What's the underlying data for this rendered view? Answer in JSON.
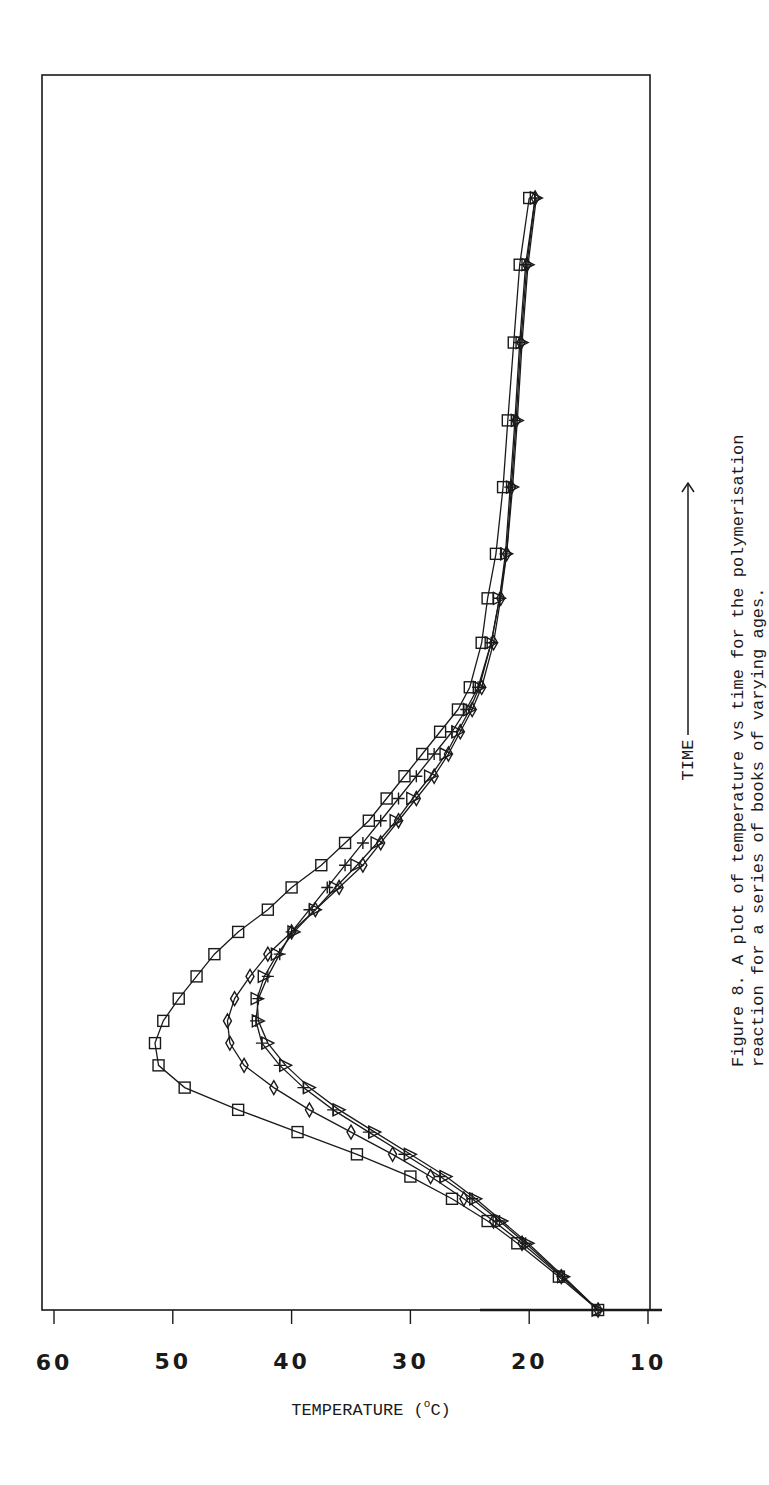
{
  "figure": {
    "caption_line1": "Figure 8. A plot of temperature vs time for the polymerisation",
    "caption_line2": "reaction for a series of books of varying ages.",
    "x_axis_title": "TIME",
    "y_axis_title": "TEMPERATURE (°C)",
    "y_axis_title_main": "TEMPERATURE",
    "y_axis_title_unit": "(oC)",
    "time_arrow": "→"
  },
  "chart_data": {
    "type": "line",
    "xlabel": "TIME",
    "ylabel": "TEMPERATURE (°C)",
    "ylim": [
      10,
      60
    ],
    "yticks": [
      10,
      20,
      30,
      40,
      50,
      60
    ],
    "xlim": [
      0,
      100
    ],
    "x_ticks_labeled": false,
    "grid": false,
    "legend": null,
    "orientation_note": "figure printed rotated 90° counter-clockwise on the page",
    "x": [
      0,
      3,
      6,
      8,
      10,
      12,
      14,
      16,
      18,
      20,
      22,
      24,
      26,
      28,
      30,
      32,
      34,
      36,
      38,
      40,
      42,
      44,
      46,
      48,
      50,
      52,
      54,
      56,
      60,
      64,
      68,
      74,
      80,
      87,
      94,
      100
    ],
    "series": [
      {
        "name": "Series 1 (square markers)",
        "marker": "square",
        "values": [
          14.2,
          17.5,
          21.0,
          23.5,
          26.5,
          30.0,
          34.5,
          39.5,
          44.5,
          49.0,
          51.2,
          51.5,
          50.8,
          49.5,
          48.0,
          46.5,
          44.5,
          42.0,
          40.0,
          37.5,
          35.5,
          33.5,
          32.0,
          30.5,
          29.0,
          27.5,
          26.0,
          25.0,
          24.0,
          23.5,
          22.8,
          22.2,
          21.8,
          21.3,
          20.8,
          20.0
        ]
      },
      {
        "name": "Series 2 (plus markers)",
        "marker": "plus",
        "values": [
          14.2,
          17.2,
          20.3,
          22.5,
          24.8,
          27.5,
          30.5,
          33.5,
          36.5,
          39.0,
          41.0,
          42.5,
          43.0,
          42.8,
          42.0,
          41.0,
          40.0,
          38.5,
          37.0,
          35.5,
          34.0,
          32.5,
          31.0,
          29.5,
          28.0,
          26.5,
          25.3,
          24.3,
          23.2,
          22.5,
          22.0,
          21.6,
          21.2,
          20.8,
          20.3,
          19.5
        ]
      },
      {
        "name": "Series 3 (diamond markers)",
        "marker": "diamond",
        "values": [
          14.2,
          17.3,
          20.6,
          23.0,
          25.5,
          28.3,
          31.5,
          35.0,
          38.5,
          41.5,
          44.0,
          45.2,
          45.4,
          44.8,
          43.5,
          42.0,
          40.0,
          38.0,
          36.0,
          34.0,
          32.5,
          31.0,
          29.5,
          28.0,
          26.8,
          25.8,
          24.8,
          24.0,
          23.0,
          22.4,
          21.9,
          21.5,
          21.1,
          20.7,
          20.2,
          19.5
        ]
      },
      {
        "name": "Series 4 (triangle markers)",
        "marker": "triangle",
        "values": [
          14.2,
          17.1,
          20.1,
          22.3,
          24.5,
          27.0,
          30.0,
          33.0,
          36.0,
          38.5,
          40.5,
          42.0,
          42.8,
          42.9,
          42.3,
          41.2,
          39.8,
          38.0,
          36.3,
          34.5,
          32.8,
          31.2,
          29.8,
          28.3,
          27.0,
          26.0,
          25.0,
          24.2,
          23.2,
          22.5,
          21.9,
          21.4,
          21.0,
          20.6,
          20.1,
          19.4
        ]
      }
    ]
  }
}
